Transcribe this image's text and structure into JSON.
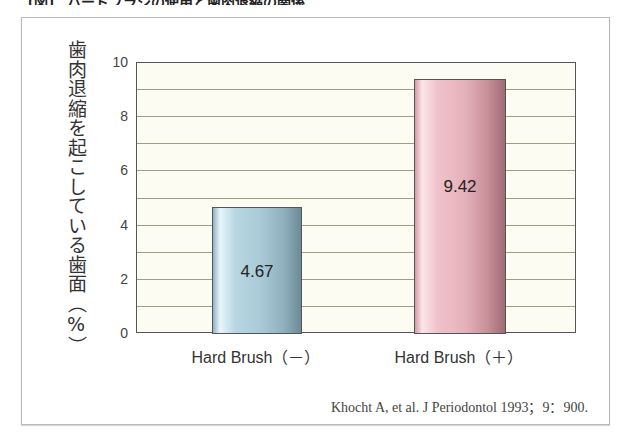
{
  "header": {
    "title_cut": "【図】 ハードブラシの使用と歯肉退縮の関係"
  },
  "chart_data": {
    "type": "bar",
    "title": "",
    "categories": [
      "Hard Brush（－）",
      "Hard Brush（＋）"
    ],
    "values": [
      4.67,
      9.42
    ],
    "data_labels": [
      "4.67",
      "9.42"
    ],
    "series": [
      {
        "name": "歯肉退縮を起こしている歯面（%）",
        "values": [
          4.67,
          9.42
        ]
      }
    ],
    "colors": [
      "#a9c9d6",
      "#e5b2bb"
    ],
    "xlabel": "",
    "ylabel": "歯肉退縮を起こしている歯面（%）",
    "ylim": [
      0,
      10
    ],
    "yticks": [
      "0",
      "2",
      "4",
      "6",
      "8",
      "10"
    ],
    "grid": true,
    "grid_step": 1,
    "legend": "none",
    "source": "Khocht A, et al. J Periodontol 1993；9：900."
  }
}
